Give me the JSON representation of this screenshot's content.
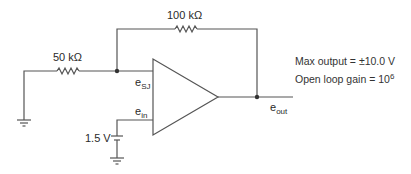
{
  "components": {
    "feedback_resistor": {
      "label": "100 kΩ"
    },
    "input_resistor": {
      "label": "50 kΩ"
    },
    "battery": {
      "label": "1.5 V"
    }
  },
  "nodes": {
    "summing_junction": {
      "base": "e",
      "sub": "SJ"
    },
    "noninverting_input": {
      "base": "e",
      "sub": "in"
    },
    "output": {
      "base": "e",
      "sub": "out"
    }
  },
  "specs": {
    "max_output": "Max output = ±10.0 V",
    "open_loop_gain_prefix": "Open loop gain = 10",
    "open_loop_gain_exp": "6"
  },
  "colors": {
    "wire": "#555555",
    "text": "#2a2a2a"
  }
}
